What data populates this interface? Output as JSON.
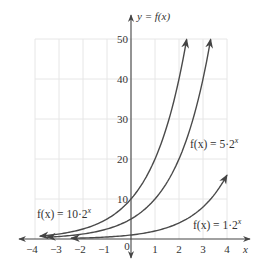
{
  "chart_data": {
    "type": "line",
    "title": "",
    "xlabel": "x",
    "ylabel": "y = f(x)",
    "xlim": [
      -4,
      4
    ],
    "ylim": [
      0,
      50
    ],
    "x_ticks": [
      -4,
      -3,
      -2,
      -1,
      0,
      1,
      2,
      3,
      4
    ],
    "x_tick_labels": [
      "−4",
      "−3",
      "−2",
      "−1",
      "0",
      "1",
      "2",
      "3",
      "4"
    ],
    "y_ticks": [
      10,
      20,
      30,
      40,
      50
    ],
    "y_tick_labels": [
      "10",
      "20",
      "30",
      "40",
      "50"
    ],
    "grid": true,
    "series": [
      {
        "name": "f(x) = 10·2^x",
        "label_main": "f(x) = 10·2",
        "label_exp": "x",
        "coefficient": 10,
        "base": 2,
        "x": [
          -3.8,
          -3,
          -2,
          -1,
          0,
          1,
          2,
          2.32
        ],
        "values": [
          0.72,
          1.25,
          2.5,
          5,
          10,
          20,
          40,
          50
        ]
      },
      {
        "name": "f(x) = 5·2^x",
        "label_main": "f(x) = 5·2",
        "label_exp": "x",
        "coefficient": 5,
        "base": 2,
        "x": [
          -3.5,
          -3,
          -2,
          -1,
          0,
          1,
          2,
          3,
          3.32
        ],
        "values": [
          0.44,
          0.63,
          1.25,
          2.5,
          5,
          10,
          20,
          40,
          50
        ]
      },
      {
        "name": "f(x) = 1·2^x",
        "label_main": "f(x) = 1·2",
        "label_exp": "x",
        "coefficient": 1,
        "base": 2,
        "x": [
          -2.5,
          -2,
          -1,
          0,
          1,
          2,
          3,
          4
        ],
        "values": [
          0.18,
          0.25,
          0.5,
          1,
          2,
          4,
          8,
          16
        ]
      }
    ]
  }
}
